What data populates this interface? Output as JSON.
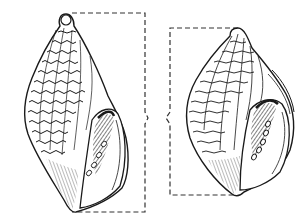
{
  "image": {
    "title": "Two gastropod shells line drawing",
    "description": "Engraving-style illustration of two sculptured sea snail shells (ventral views showing apertures with teeth), each connected by a dashed bracket with a brace mark",
    "colors": {
      "ink": "#1a1a1a",
      "paper": "#ffffff",
      "dash": "#333333"
    },
    "figures": [
      {
        "name": "left-shell",
        "view": "aperture facing right"
      },
      {
        "name": "right-shell",
        "view": "aperture facing right, slightly rotated"
      }
    ]
  }
}
